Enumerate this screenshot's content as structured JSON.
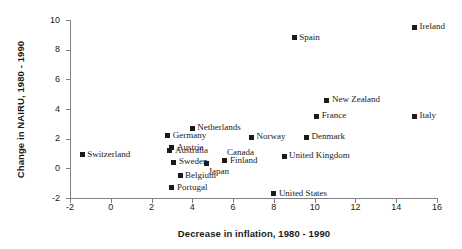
{
  "chart_data": {
    "type": "scatter",
    "title": "",
    "xlabel": "Decrease in inflation, 1980 - 1990",
    "ylabel": "Change in NAIRU, 1980 - 1990",
    "xlim": [
      -2,
      16
    ],
    "ylim": [
      -2,
      10
    ],
    "xticks": [
      -2,
      0,
      2,
      4,
      6,
      8,
      10,
      12,
      14,
      16
    ],
    "yticks": [
      -2,
      0,
      2,
      4,
      6,
      8,
      10
    ],
    "grid": false,
    "legend": "none",
    "marker": "filled-square",
    "marker_color": "#1a1a1a",
    "points": [
      {
        "label": "Switzerland",
        "x": -1.4,
        "y": 0.9,
        "label_pos": "right"
      },
      {
        "label": "Germany",
        "x": 2.8,
        "y": 2.2,
        "label_pos": "right"
      },
      {
        "label": "Netherlands",
        "x": 4.0,
        "y": 2.7,
        "label_pos": "right"
      },
      {
        "label": "Austria",
        "x": 3.0,
        "y": 1.4,
        "label_pos": "right"
      },
      {
        "label": "Australia",
        "x": 2.9,
        "y": 1.2,
        "label_pos": "right"
      },
      {
        "label": "Sweden",
        "x": 3.1,
        "y": 0.4,
        "label_pos": "right"
      },
      {
        "label": "Japan",
        "x": 4.7,
        "y": 0.3,
        "label_pos": "below-right"
      },
      {
        "label": "Belgium",
        "x": 3.4,
        "y": -0.5,
        "label_pos": "right"
      },
      {
        "label": "Portugal",
        "x": 3.0,
        "y": -1.3,
        "label_pos": "right"
      },
      {
        "label": "Canada",
        "x": 5.6,
        "y": 0.5,
        "label_pos": "above-right"
      },
      {
        "label": "Finland",
        "x": 5.6,
        "y": 0.5,
        "label_pos": "right"
      },
      {
        "label": "Norway",
        "x": 6.9,
        "y": 2.1,
        "label_pos": "right"
      },
      {
        "label": "Denmark",
        "x": 9.6,
        "y": 2.1,
        "label_pos": "right"
      },
      {
        "label": "United Kingdom",
        "x": 8.5,
        "y": 0.8,
        "label_pos": "right"
      },
      {
        "label": "United States",
        "x": 8.0,
        "y": -1.7,
        "label_pos": "right"
      },
      {
        "label": "France",
        "x": 10.1,
        "y": 3.5,
        "label_pos": "right"
      },
      {
        "label": "New Zealand",
        "x": 10.6,
        "y": 4.6,
        "label_pos": "right"
      },
      {
        "label": "Spain",
        "x": 9.0,
        "y": 8.8,
        "label_pos": "right"
      },
      {
        "label": "Ireland",
        "x": 14.9,
        "y": 9.5,
        "label_pos": "right"
      },
      {
        "label": "Italy",
        "x": 14.9,
        "y": 3.5,
        "label_pos": "right"
      }
    ]
  },
  "colors": {
    "axis": "#808080",
    "text": "#1a1a1a",
    "marker": "#1a1a1a",
    "background": "#ffffff"
  }
}
